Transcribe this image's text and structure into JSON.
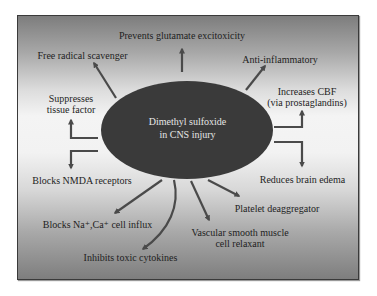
{
  "diagram": {
    "center": {
      "line1": "Dimethyl sulfoxide",
      "line2": "in CNS injury"
    },
    "effects": [
      {
        "id": "glutamate",
        "line1": "Prevents glutamate excitoxicity"
      },
      {
        "id": "free-radical",
        "line1": "Free radical scavenger"
      },
      {
        "id": "anti-inflammatory",
        "line1": "Anti-inflammatory"
      },
      {
        "id": "tissue-factor",
        "line1": "Suppresses",
        "line2": "tissue factor"
      },
      {
        "id": "cbf",
        "line1": "Increases CBF",
        "line2": "(via prostaglandins)"
      },
      {
        "id": "nmda",
        "line1": "Blocks NMDA receptors"
      },
      {
        "id": "edema",
        "line1": "Reduces brain edema"
      },
      {
        "id": "platelet",
        "line1": "Platelet deaggregator"
      },
      {
        "id": "na-ca",
        "line1": "Blocks Na⁺,Ca⁺ cell influx"
      },
      {
        "id": "vascular",
        "line1": "Vascular smooth muscle",
        "line2": "cell relaxant"
      },
      {
        "id": "cytokines",
        "line1": "Inhibits toxic cytokines"
      }
    ],
    "colors": {
      "ellipse": "#3a3a3a",
      "arrow": "#4a4a4a",
      "text": "#1e1e1e",
      "center_text": "#e6e6e6"
    }
  }
}
